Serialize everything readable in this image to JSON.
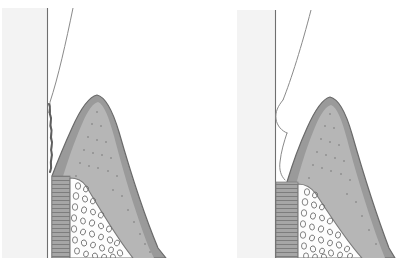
{
  "figure": {
    "background_color": "#ffffff",
    "width": 398,
    "height": 275,
    "panel_count": 2
  },
  "palette": {
    "page_background": "#ffffff",
    "tooth_band": "#f3f3f3",
    "tooth_outline": "#6f6f6f",
    "crown_contour_line": "#8a8a8a",
    "gingiva_epithelium": "#9a9a9a",
    "gingiva_epithelium_outline": "#6a6a6a",
    "connective_tissue": "#b6b6b6",
    "connective_tissue_stipple": "#8f8f8f",
    "pdl_band": "#a6a6a6",
    "pdl_stripe": "#7d7d7d",
    "bone_fill": "#fdfdfd",
    "bone_outline": "#7a7a7a",
    "marrow_space_outline": "#6e6e6e",
    "caption_text": "#b9b9b9",
    "deposit_line": "#5e5e5e"
  },
  "panels": [
    {
      "id": "panel-left",
      "label": "Left panel",
      "caption": "",
      "caption_note": "faint illegible caption clipped at page bottom edge",
      "tooth_band_label": "tooth-enamel-band",
      "root_surface_label": "irregular-root-surface-deposit",
      "root_surface_type": "jagged",
      "papilla_label": "interdental-papilla",
      "papilla_apex_height": "tall-pointed",
      "pdl_label": "periodontal-ligament-band",
      "pdl_stripe_count": 14,
      "bone_label": "alveolar-trabecular-bone",
      "marrow_space_count": 31,
      "stipple_count": 23
    },
    {
      "id": "panel-right",
      "label": "Right panel",
      "caption": "",
      "caption_note": "faint illegible caption clipped at page bottom edge",
      "tooth_band_label": "tooth-enamel-band",
      "root_surface_label": "smooth-restoration-margin-contour",
      "root_surface_type": "smooth-rounded",
      "papilla_label": "interdental-papilla",
      "papilla_apex_height": "tall-rounded",
      "pdl_label": "periodontal-ligament-band",
      "pdl_stripe_count": 16,
      "bone_label": "alveolar-trabecular-bone",
      "marrow_space_count": 29,
      "stipple_count": 21
    }
  ]
}
